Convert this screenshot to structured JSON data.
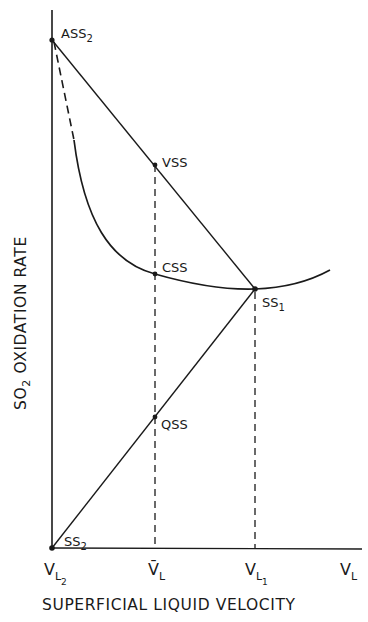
{
  "diagram": {
    "y_axis_title": {
      "main": "SO",
      "sub": "2",
      "rest": " OXIDATION RATE"
    },
    "x_axis_title": "SUPERFICIAL LIQUID VELOCITY",
    "x_ticks": [
      {
        "main": "V",
        "sub": "L",
        "subsub": "2"
      },
      {
        "main": "V̄",
        "sub": "L"
      },
      {
        "main": "V",
        "sub": "L",
        "subsub": "1"
      },
      {
        "main": "V",
        "sub": "L"
      }
    ],
    "points": {
      "ass2": {
        "main": "ASS",
        "sub": "2"
      },
      "vss": {
        "main": "VSS"
      },
      "css": {
        "main": "CSS"
      },
      "ss1": {
        "main": "SS",
        "sub": "1"
      },
      "qss": {
        "main": "QSS"
      },
      "ss2": {
        "main": "SS",
        "sub": "2"
      }
    },
    "colors": {
      "ink": "#1a1a1a",
      "background": "#ffffff"
    }
  }
}
